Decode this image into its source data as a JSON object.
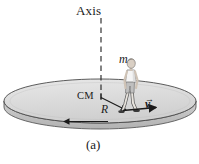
{
  "figure": {
    "panel_label": "(a)",
    "background_color": "#ffffff",
    "ink_color": "#1a1a1a"
  },
  "labels": {
    "axis": "Axis",
    "mass": "m",
    "center_of_mass": "CM",
    "radius": "R",
    "velocity": "v",
    "velocity_vector_accent": "→"
  },
  "platform": {
    "name": "rotating-disk",
    "top_fill": "#dcdcdc",
    "side_fill": "#c4c4c4",
    "outline_color": "#4a4a4a",
    "center_x": 100,
    "center_y": 101,
    "radius_x": 96,
    "radius_y": 22,
    "thickness": 12
  },
  "axis_line": {
    "name": "rotation-axis",
    "style": "dashed",
    "x": 101,
    "y_top": 18,
    "y_bottom": 99,
    "color": "#2a2a2a"
  },
  "radius_vector": {
    "name": "radius-arrow",
    "from_x": 101,
    "from_y": 97,
    "to_x": 127,
    "to_y": 110,
    "color": "#1a1a1a"
  },
  "velocity_vector": {
    "name": "velocity-arrow",
    "from_x": 122,
    "from_y": 110,
    "to_x": 157,
    "to_y": 107,
    "color": "#1a1a1a"
  },
  "rotation_arrow": {
    "name": "rotation-direction-arrow",
    "from_x": 108,
    "from_y": 122,
    "to_x": 62,
    "to_y": 122,
    "direction": "left",
    "color": "#1a1a1a"
  },
  "person": {
    "name": "walking-person",
    "shirt_color": "#f2f2f2",
    "shorts_color": "#b8b8b8",
    "skin_color": "#d9cfc4",
    "hair_color": "#8f8880",
    "outline_color": "#5a5a5a",
    "head_x": 133,
    "head_y": 64
  }
}
